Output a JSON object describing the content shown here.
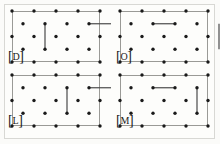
{
  "figure": {
    "title": "",
    "panel_count": 4,
    "colors": {
      "background": "#fbfbf9",
      "outer_border": "#d8d8d4",
      "panel_frame": "#9a9a96",
      "dot": "#1a1a1a",
      "bond": "#4a4a4a",
      "label_text": "#181818"
    },
    "lattice": {
      "major_cols": 5,
      "offset_cols": 4,
      "major_rows": 3,
      "offset_rows": 2,
      "dot_radius": 1.7,
      "cell_w": 19.5,
      "cell_h": 16.0
    }
  },
  "panels": [
    {
      "id": "panel-d",
      "label_bracket_open": "[",
      "label_letter": "D",
      "label_bracket_close": "]",
      "position": "top-left",
      "x": 12,
      "y": 11,
      "width": 88,
      "height": 51,
      "label_x": 8,
      "label_y": 51,
      "bonds": [
        {
          "name": "bond-vertical-left",
          "orientation": "vertical",
          "col": 1,
          "row": 1,
          "length": 1
        },
        {
          "name": "bond-horizontal-upper-right",
          "orientation": "horizontal",
          "col": 3,
          "row": 1,
          "length": 1
        }
      ]
    },
    {
      "id": "panel-o",
      "label_bracket_open": "[",
      "label_letter": "O",
      "label_bracket_close": "]",
      "position": "top-right",
      "x": 120,
      "y": 11,
      "width": 88,
      "height": 51,
      "label_x": 116,
      "label_y": 51,
      "bonds": [
        {
          "name": "bond-horizontal-upper-left",
          "orientation": "horizontal",
          "col": 1,
          "row": 1,
          "length": 1
        },
        {
          "name": "bond-vertical-right",
          "orientation": "vertical",
          "col": 4,
          "row": 1,
          "length": 1
        }
      ]
    },
    {
      "id": "panel-l",
      "label_bracket_open": "[",
      "label_letter": "L",
      "label_bracket_close": "]",
      "position": "bottom-left",
      "x": 12,
      "y": 75,
      "width": 88,
      "height": 51,
      "label_x": 8,
      "label_y": 115,
      "bonds": [
        {
          "name": "bond-vertical-mid-left",
          "orientation": "vertical",
          "col": 2,
          "row": 1,
          "length": 1
        },
        {
          "name": "bond-horizontal-upper-right",
          "orientation": "horizontal",
          "col": 3,
          "row": 1,
          "length": 1
        }
      ]
    },
    {
      "id": "panel-m",
      "label_bracket_open": "[",
      "label_letter": "M",
      "label_bracket_close": "]",
      "position": "bottom-right",
      "x": 120,
      "y": 75,
      "width": 88,
      "height": 51,
      "label_x": 116,
      "label_y": 115,
      "bonds": [
        {
          "name": "bond-horizontal-upper-left",
          "orientation": "horizontal",
          "col": 1,
          "row": 1,
          "length": 1
        },
        {
          "name": "bond-vertical-mid-right",
          "orientation": "vertical",
          "col": 3,
          "row": 1,
          "length": 1
        }
      ]
    }
  ]
}
